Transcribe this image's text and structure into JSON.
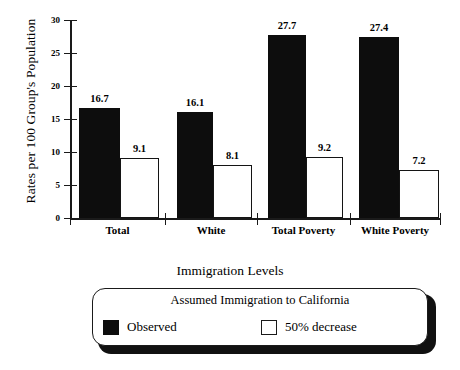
{
  "chart_data": {
    "type": "bar",
    "title": "",
    "xlabel": "Immigration Levels",
    "ylabel": "Rates per 100 Group's Population",
    "categories": [
      "Total",
      "White",
      "Total Poverty",
      "White Poverty"
    ],
    "series": [
      {
        "name": "Observed",
        "color": "#0d0d0d",
        "values": [
          16.7,
          16.1,
          27.7,
          27.4
        ]
      },
      {
        "name": "50% decrease",
        "color": "#ffffff",
        "values": [
          9.1,
          8.1,
          9.2,
          7.2
        ]
      }
    ],
    "ylim": [
      0,
      30
    ],
    "yticks": [
      0,
      5,
      10,
      15,
      20,
      25,
      30
    ],
    "grid": false,
    "legend_position": "bottom",
    "legend_title": "Assumed Immigration to California",
    "data_labels": true
  },
  "legend": {
    "outer_title": "Immigration Levels",
    "inner_title": "Assumed Immigration to California",
    "entries": [
      {
        "label": "Observed",
        "swatch": "filled-black-square"
      },
      {
        "label": "50% decrease",
        "swatch": "outlined-white-square"
      }
    ]
  }
}
